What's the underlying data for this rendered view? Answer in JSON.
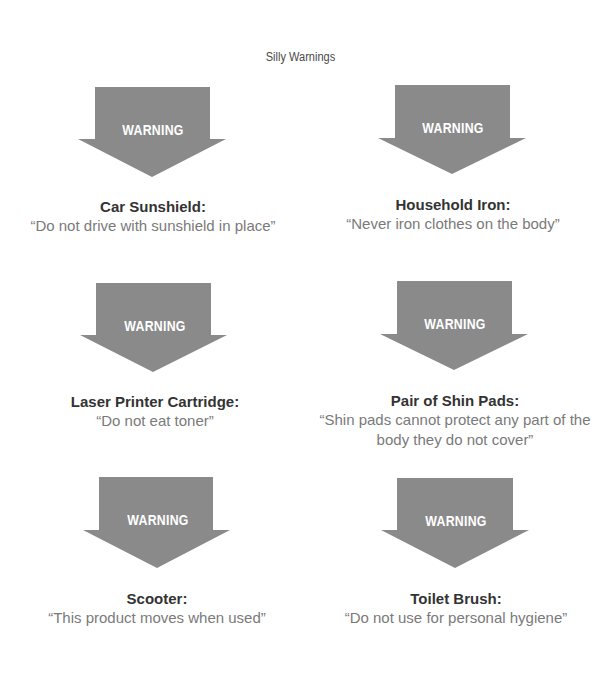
{
  "title": "Silly Warnings",
  "colors": {
    "arrow": "#8a8a8a",
    "arrow_text": "#ffffff",
    "product": "#333333",
    "quote": "#7a7a7a"
  },
  "arrow_label": "WARNING",
  "arrow_icon": "down-arrow-icon",
  "warnings": [
    {
      "product": "Car Sunshield:",
      "quote": "“Do not drive with sunshield in place”"
    },
    {
      "product": "Household Iron:",
      "quote": "“Never iron clothes on the body”"
    },
    {
      "product": "Laser Printer Cartridge:",
      "quote": "“Do not eat toner”"
    },
    {
      "product": "Pair of Shin Pads:",
      "quote": "“Shin pads cannot protect any part of the body they do not cover”"
    },
    {
      "product": "Scooter:",
      "quote": "“This product moves when used”"
    },
    {
      "product": "Toilet Brush:",
      "quote": "“Do not use for personal hygiene”"
    }
  ]
}
